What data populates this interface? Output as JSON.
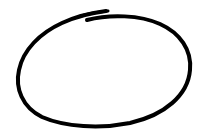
{
  "drawing": {
    "shape": "hand-drawn-ellipse",
    "stroke_color": "#000000",
    "background_color": "#ffffff",
    "stroke_width": 4
  }
}
